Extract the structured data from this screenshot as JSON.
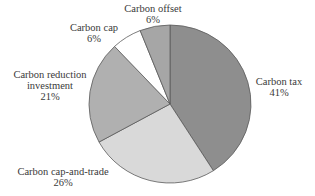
{
  "chart_data": {
    "type": "pie",
    "title": "",
    "start_angle_deg": 0,
    "direction": "clockwise",
    "slices": [
      {
        "label": "Carbon tax",
        "value": 41,
        "display": "41%",
        "color": "#8e8e8e"
      },
      {
        "label": "Carbon cap-and-trade",
        "value": 26,
        "display": "26%",
        "color": "#d9d9d9"
      },
      {
        "label": "Carbon reduction investment",
        "value": 21,
        "display": "21%",
        "color": "#b0b0b0"
      },
      {
        "label": "Carbon cap",
        "value": 6,
        "display": "6%",
        "color": "#ffffff"
      },
      {
        "label": "Carbon offset",
        "value": 6,
        "display": "6%",
        "color": "#a6a6a6"
      }
    ],
    "categories": [
      "Carbon tax",
      "Carbon cap-and-trade",
      "Carbon reduction investment",
      "Carbon cap",
      "Carbon offset"
    ],
    "values": [
      41,
      26,
      21,
      6,
      6
    ],
    "legend": "none (labels placed beside slices)"
  },
  "labels": {
    "tax": {
      "name": "Carbon tax",
      "pct": "41%"
    },
    "cap_and_trade": {
      "name": "Carbon cap-and-trade",
      "pct": "26%"
    },
    "reduction": {
      "line1": "Carbon reduction",
      "line2": "investment",
      "pct": "21%"
    },
    "cap": {
      "name": "Carbon cap",
      "pct": "6%"
    },
    "offset": {
      "name": "Carbon offset",
      "pct": "6%"
    }
  }
}
